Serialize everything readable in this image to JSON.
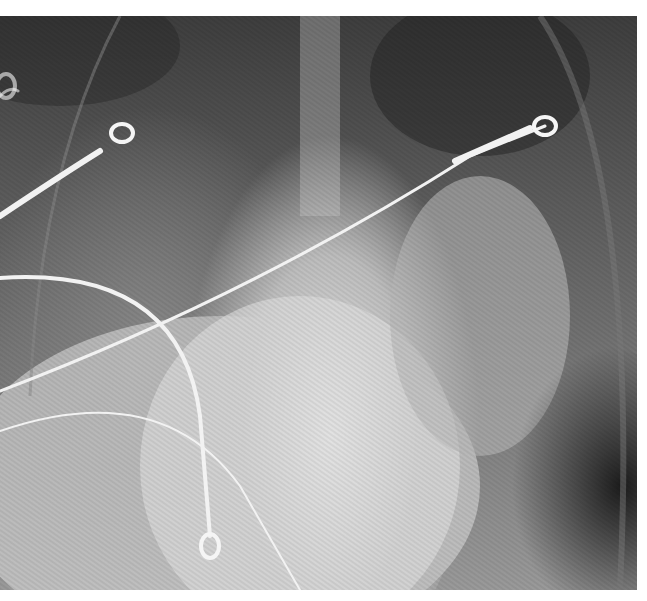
{
  "image": {
    "subject": "Frontal chest radiograph",
    "alt": "Chest X-ray with diffuse bilateral opacities and ECG lead wires/electrodes overlying the chest"
  },
  "annotations": {
    "visible_text": []
  },
  "colors": {
    "background": "#ffffff",
    "film_dark": "#2a2a2a",
    "film_mid": "#6a6a6a",
    "film_light": "#d8d8d8",
    "wire": "#f2f2f2"
  }
}
